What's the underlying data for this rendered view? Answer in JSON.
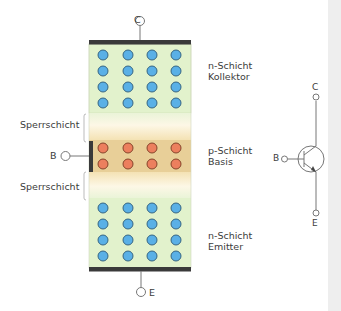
{
  "diagram": {
    "type": "npn-transistor-structure",
    "terminals": {
      "collector": "C",
      "base": "B",
      "emitter": "E"
    },
    "layers": [
      {
        "name": "n-Schicht",
        "role": "Kollektor",
        "carrier_color": "#5ab0e6",
        "rows": 4,
        "cols": 4
      },
      {
        "name": "Sperrschicht",
        "role": "junction"
      },
      {
        "name": "p-Schicht",
        "role": "Basis",
        "carrier_color": "#ec7f5e",
        "rows": 2,
        "cols": 4
      },
      {
        "name": "Sperrschicht",
        "role": "junction"
      },
      {
        "name": "n-Schicht",
        "role": "Emitter",
        "carrier_color": "#5ab0e6",
        "rows": 4,
        "cols": 4
      }
    ],
    "labels": {
      "n_top_1": "n-Schicht",
      "n_top_2": "Kollektor",
      "p_1": "p-Schicht",
      "p_2": "Basis",
      "n_bottom_1": "n-Schicht",
      "n_bottom_2": "Emitter",
      "junction_top": "Sperrschicht",
      "junction_bottom": "Sperrschicht",
      "term_c": "C",
      "term_b": "B",
      "term_e": "E",
      "sym_c": "C",
      "sym_b": "B",
      "sym_e": "E"
    },
    "colors": {
      "n_region": "#e2f2cc",
      "p_region": "#e8cf98",
      "junction": "#fbf0d6",
      "contact_bar": "#3a3a3a",
      "wire": "#777777"
    }
  }
}
